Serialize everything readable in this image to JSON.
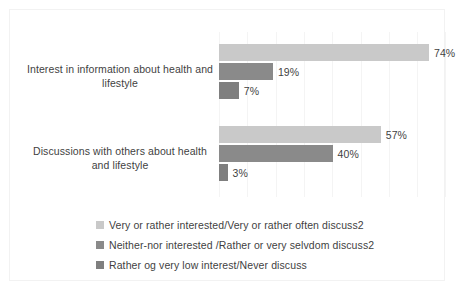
{
  "chart_data": {
    "type": "bar",
    "orientation": "horizontal",
    "title": "",
    "subtitle": "",
    "xlabel": "",
    "ylabel": "",
    "xlim": [
      0,
      80
    ],
    "grid": true,
    "gridline_interval": 10,
    "legend_position": "bottom",
    "value_suffix": "%",
    "categories": [
      "Interest in information about health and lifestyle",
      "Discussions with others about health and lifestyle"
    ],
    "series": [
      {
        "name": "Very or rather interested/Very or rather often discuss2",
        "color": "#c9c9c9",
        "values": [
          74,
          57
        ],
        "labels": [
          "74%",
          "57%"
        ]
      },
      {
        "name": "Neither-nor interested /Rather or very selvdom discuss2",
        "color": "#8a8a8a",
        "values": [
          19,
          40
        ],
        "labels": [
          "19%",
          "40%"
        ]
      },
      {
        "name": "Rather og very low interest/Never discuss",
        "color": "#7f7f7f",
        "values": [
          7,
          3
        ],
        "labels": [
          "7%",
          "3%"
        ]
      }
    ]
  },
  "legend": {
    "items": [
      {
        "label": "Very or rather interested/Very or rather often discuss2",
        "swatch": "#c9c9c9"
      },
      {
        "label": "Neither-nor interested /Rather or very selvdom discuss2",
        "swatch": "#8a8a8a"
      },
      {
        "label": "Rather og very low interest/Never discuss",
        "swatch": "#7f7f7f"
      }
    ]
  },
  "colors": {
    "series_1": "#c9c9c9",
    "series_2": "#8a8a8a",
    "series_3": "#7f7f7f",
    "text": "#3f3f3f",
    "gridline": "#f4f4f4",
    "frame_border": "#f2f2f2",
    "background": "#ffffff"
  }
}
